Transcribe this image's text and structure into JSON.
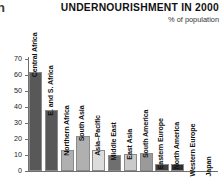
{
  "fragment": {
    "glyph": "n"
  },
  "header": {
    "title": "UNDERNOURISHMENT IN 2000",
    "subtitle": "% of population"
  },
  "axis": {
    "y_ticks": [
      "0",
      "10",
      "20",
      "30",
      "40",
      "50",
      "60",
      "70"
    ]
  },
  "chart_data": {
    "type": "bar",
    "title": "UNDERNOURISHMENT IN 2000",
    "subtitle": "% of population",
    "xlabel": "",
    "ylabel": "% of population",
    "ylim": [
      0,
      70
    ],
    "ytick_step": 10,
    "grid": false,
    "legend": "none",
    "orientation": "vertical",
    "label_rotation": -90,
    "categories": [
      "Central Africa",
      "E. and S. Africa",
      "Northern Africa",
      "South Asia",
      "Asia–Pacific",
      "Middle East",
      "East Asia",
      "South America",
      "Eastern Europe",
      "North America",
      "Western Europe",
      "Japan"
    ],
    "values": [
      62,
      38,
      13,
      22,
      13,
      10,
      10.5,
      11.5,
      4.5,
      4.5,
      0,
      0
    ],
    "colors": [
      "#585858",
      "#585858",
      "#b0b0b0",
      "#b0b0b0",
      "#dcdcdc",
      "#6f6f6f",
      "#cacaca",
      "#9a9a9a",
      "#3f3f3f",
      "#2e2e2e",
      "#ffffff",
      "#ffffff"
    ],
    "bars": [
      {
        "category": "Central Africa",
        "value": 62,
        "color": "#585858"
      },
      {
        "category": "E. and S. Africa",
        "value": 38,
        "color": "#585858"
      },
      {
        "category": "Northern Africa",
        "value": 13,
        "color": "#b0b0b0"
      },
      {
        "category": "South Asia",
        "value": 22,
        "color": "#b0b0b0"
      },
      {
        "category": "Asia–Pacific",
        "value": 13,
        "color": "#dcdcdc"
      },
      {
        "category": "Middle East",
        "value": 10,
        "color": "#6f6f6f"
      },
      {
        "category": "East Asia",
        "value": 10.5,
        "color": "#cacaca"
      },
      {
        "category": "South America",
        "value": 11.5,
        "color": "#9a9a9a"
      },
      {
        "category": "Eastern Europe",
        "value": 4.5,
        "color": "#3f3f3f"
      },
      {
        "category": "North America",
        "value": 4.5,
        "color": "#2e2e2e"
      },
      {
        "category": "Western Europe",
        "value": 0,
        "color": "#ffffff"
      },
      {
        "category": "Japan",
        "value": 0,
        "color": "#ffffff"
      }
    ]
  }
}
